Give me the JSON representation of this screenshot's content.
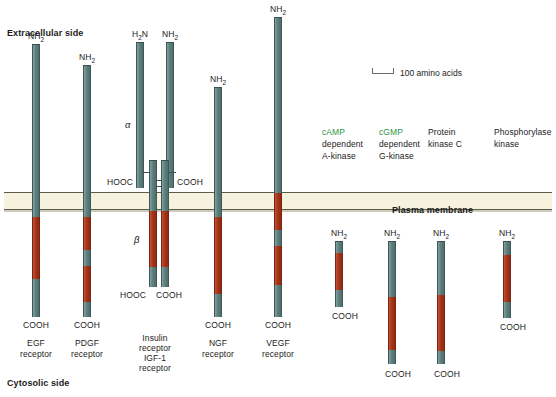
{
  "figure": {
    "top_label": "Extracellular side",
    "bottom_label": "Cytosolic side",
    "membrane_label": "Plasma membrane",
    "scale_text": "100 amino acids",
    "alpha_symbol": "α",
    "beta_symbol": "β",
    "colors": {
      "membrane": "#f7f2de",
      "teal": "#5d7f7d",
      "red": "#a83418",
      "green_text": "#2e9646",
      "background": "#ffffff"
    }
  },
  "termini": {
    "nh2": "NH",
    "nh2_sub": "2",
    "h2n_pre": "H",
    "h2n_sub": "2",
    "h2n_post": "N",
    "cooh": "COOH",
    "hooc": "HOOC"
  },
  "receptors": [
    {
      "id": "egf",
      "name_lines": [
        "EGF",
        "receptor"
      ],
      "n_terminus": "NH2",
      "c_terminus": "COOH"
    },
    {
      "id": "pdgf",
      "name_lines": [
        "PDGF",
        "receptor"
      ],
      "n_terminus": "NH2",
      "c_terminus": "COOH"
    },
    {
      "id": "insulin",
      "name_lines": [
        "Insulin",
        "receptor"
      ],
      "n_terminus": "H2N",
      "n_terminus_2": "NH2",
      "c_terminus_alpha_left": "HOOC",
      "c_terminus_alpha_right": "COOH",
      "c_terminus_beta_left": "HOOC",
      "c_terminus_beta_right": "COOH"
    },
    {
      "id": "igf1",
      "name_lines": [
        "IGF-1",
        "receptor"
      ]
    },
    {
      "id": "ngf",
      "name_lines": [
        "NGF",
        "receptor"
      ],
      "n_terminus": "NH2",
      "c_terminus": "COOH"
    },
    {
      "id": "vegf",
      "name_lines": [
        "VEGF",
        "receptor"
      ],
      "n_terminus": "NH2",
      "c_terminus": "COOH"
    }
  ],
  "cytosolic_kinases": [
    {
      "id": "camp-a-kinase",
      "name_lines": [
        "cAMP",
        "dependent",
        "A-kinase"
      ],
      "first_line_green": true,
      "n_terminus": "NH2",
      "c_terminus": "COOH"
    },
    {
      "id": "cgmp-g-kinase",
      "name_lines": [
        "cGMP",
        "dependent",
        "G-kinase"
      ],
      "first_line_green": true,
      "n_terminus": "NH2",
      "c_terminus": "COOH"
    },
    {
      "id": "protein-kinase-c",
      "name_lines": [
        "Protein",
        "kinase C"
      ],
      "first_line_green": false,
      "n_terminus": "NH2",
      "c_terminus": "COOH"
    },
    {
      "id": "phosphorylase-kinase",
      "name_lines": [
        "Phosphorylase",
        "kinase"
      ],
      "first_line_green": false,
      "n_terminus": "NH2",
      "c_terminus": "COOH"
    }
  ]
}
